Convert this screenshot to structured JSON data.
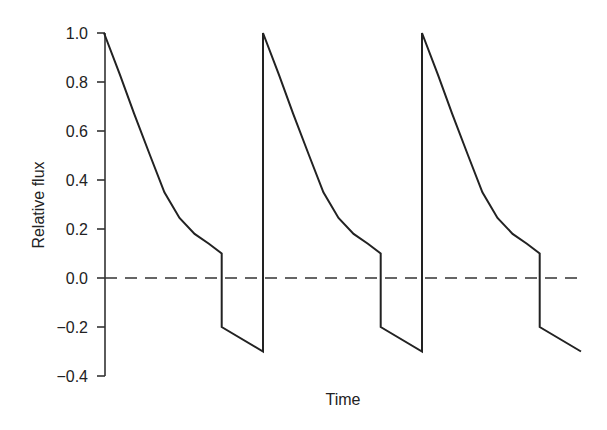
{
  "chart_data": {
    "type": "line",
    "title": "",
    "xlabel": "Time",
    "ylabel": "Relative flux",
    "ylim": [
      -0.4,
      1.0
    ],
    "yticks": [
      1.0,
      0.8,
      0.6,
      0.4,
      0.2,
      0.0,
      -0.2,
      -0.4
    ],
    "ytick_labels": [
      "1.0",
      "0.8",
      "0.6",
      "0.4",
      "0.2",
      "0.0",
      "−0.2",
      "−0.4"
    ],
    "xticks": [],
    "grid": false,
    "legend": null,
    "reference_line": {
      "y": 0.0,
      "style": "dashed"
    },
    "series": [
      {
        "name": "Relative flux",
        "style": "solid",
        "periods": 3,
        "cycle_points": [
          {
            "t": 0.0,
            "v": 1.0
          },
          {
            "t": 0.1,
            "v": 0.83
          },
          {
            "t": 0.19,
            "v": 0.67
          },
          {
            "t": 0.29,
            "v": 0.5
          },
          {
            "t": 0.38,
            "v": 0.35
          },
          {
            "t": 0.475,
            "v": 0.245
          },
          {
            "t": 0.57,
            "v": 0.18
          },
          {
            "t": 0.66,
            "v": 0.14
          },
          {
            "t": 0.74,
            "v": 0.1
          },
          {
            "t": 0.74,
            "v": -0.2
          },
          {
            "t": 1.0,
            "v": -0.3
          }
        ]
      }
    ]
  }
}
